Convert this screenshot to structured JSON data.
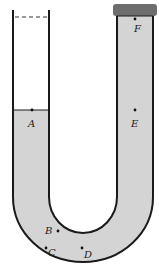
{
  "diagram": {
    "type": "u-tube-manometer",
    "colors": {
      "liquid": "#d4d4d4",
      "wall": "#1a1a1a",
      "cap": "#6e6e6e",
      "background": "#ffffff"
    },
    "points": [
      {
        "id": "A",
        "label": "A",
        "x": 32,
        "y": 110
      },
      {
        "id": "B",
        "label": "B",
        "x": 58,
        "y": 231
      },
      {
        "id": "C",
        "label": "C",
        "x": 46,
        "y": 248
      },
      {
        "id": "D",
        "label": "D",
        "x": 82,
        "y": 248
      },
      {
        "id": "E",
        "label": "E",
        "x": 135,
        "y": 110
      },
      {
        "id": "F",
        "label": "F",
        "x": 135,
        "y": 19
      }
    ],
    "left_arm": {
      "open_top": true,
      "dashed_line": true,
      "liquid_level_y": 110
    },
    "right_arm": {
      "capped": true,
      "filled_to_top": true
    }
  },
  "labels": {
    "A": "A",
    "B": "B",
    "C": "C",
    "D": "D",
    "E": "E",
    "F": "F"
  }
}
